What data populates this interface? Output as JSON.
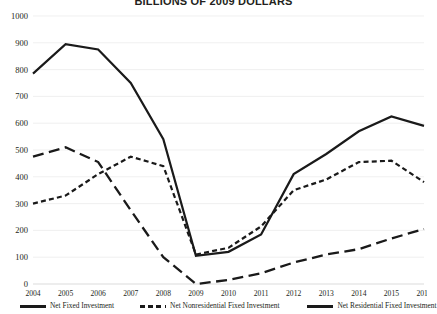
{
  "chart_data": {
    "type": "line",
    "title": "BILLIONS OF 2009 DOLLARS",
    "xlabel": "",
    "ylabel": "",
    "ylim": [
      0,
      1000
    ],
    "ytick_step": 100,
    "yticks": [
      "0",
      "100",
      "200",
      "300",
      "400",
      "500",
      "600",
      "700",
      "800",
      "900",
      "1000"
    ],
    "grid": true,
    "legend_position": "bottom",
    "categories": [
      "2004",
      "2005",
      "2006",
      "2007",
      "2008",
      "2009",
      "2010",
      "2011",
      "2012",
      "2013",
      "2014",
      "2015",
      "2016"
    ],
    "series": [
      {
        "name": "Net Fixed Investment",
        "style": "solid",
        "color": "#1a1a1a",
        "values": [
          785,
          895,
          875,
          750,
          540,
          105,
          120,
          185,
          410,
          485,
          570,
          625,
          590
        ]
      },
      {
        "name": "Net Nonresidential Fixed Investment",
        "style": "dotted",
        "color": "#1a1a1a",
        "values": [
          300,
          330,
          410,
          475,
          440,
          110,
          135,
          215,
          350,
          390,
          455,
          460,
          380
        ]
      },
      {
        "name": "Net Residential Fixed Investment",
        "style": "dashed",
        "color": "#1a1a1a",
        "values": [
          475,
          510,
          455,
          275,
          100,
          0,
          15,
          40,
          80,
          110,
          130,
          170,
          205
        ]
      }
    ]
  }
}
